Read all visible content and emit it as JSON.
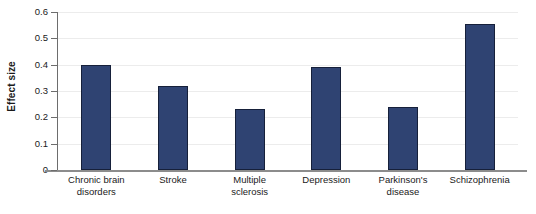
{
  "chart_data": {
    "type": "bar",
    "title": "",
    "xlabel": "",
    "ylabel": "Effect size",
    "ylim": [
      0,
      0.6
    ],
    "grid": true,
    "legend": "none",
    "categories": [
      "Chronic brain disorders",
      "Stroke",
      "Multiple sclerosis",
      "Depression",
      "Parkinson's disease",
      "Schizophrenia"
    ],
    "category_lines": [
      [
        "Chronic brain",
        "disorders"
      ],
      [
        "Stroke"
      ],
      [
        "Multiple",
        "sclerosis"
      ],
      [
        "Depression"
      ],
      [
        "Parkinson's",
        "disease"
      ],
      [
        "Schizophrenia"
      ]
    ],
    "values": [
      0.4,
      0.32,
      0.23,
      0.39,
      0.24,
      0.555
    ],
    "y_ticks": [
      0,
      0.1,
      0.2,
      0.3,
      0.4,
      0.5,
      0.6
    ],
    "y_tick_labels": [
      "0",
      "0.1",
      "0.2",
      "0.3",
      "0.4",
      "0.5",
      "0.6"
    ],
    "bar_color": "#2f4372",
    "bar_edge_color": "#16203a",
    "gridline_color": "#ececec",
    "axis_color": "#6d6d6d"
  }
}
